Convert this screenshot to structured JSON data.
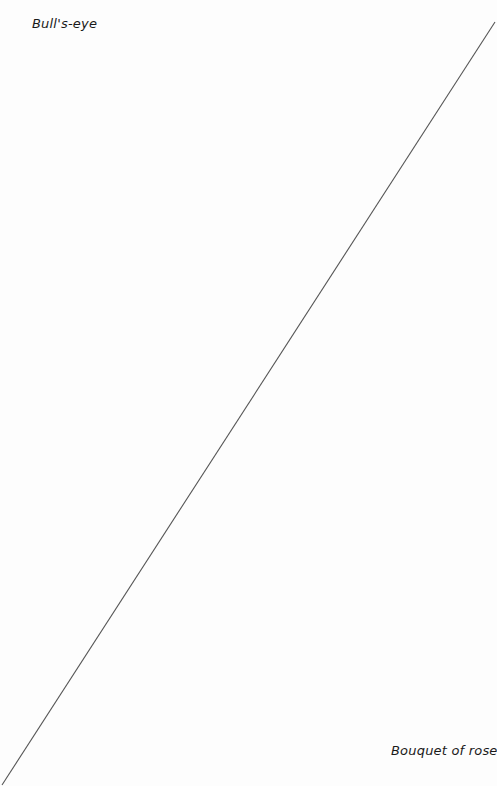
{
  "labels": {
    "top_left": "Bull's-eye",
    "bottom_right": "Bouquet of roses"
  },
  "connector": {
    "x1": 495,
    "y1": 22,
    "x2": 2,
    "y2": 785,
    "color": "#555555"
  }
}
